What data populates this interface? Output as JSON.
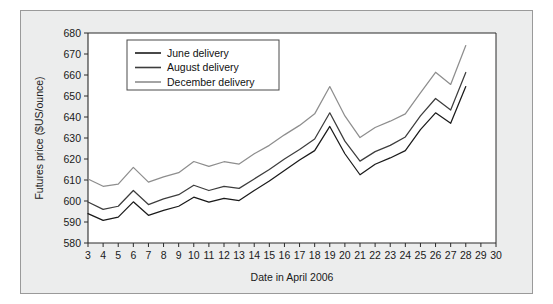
{
  "chart_data": {
    "type": "line",
    "title": "",
    "xlabel": "Date in April 2006",
    "ylabel": "Futures price ($US/ounce)",
    "xlim": [
      3,
      30
    ],
    "ylim": [
      580,
      680
    ],
    "yticks": [
      580,
      590,
      600,
      610,
      620,
      630,
      640,
      650,
      660,
      670,
      680
    ],
    "xticks": [
      3,
      4,
      5,
      6,
      7,
      8,
      9,
      10,
      11,
      12,
      13,
      14,
      15,
      16,
      17,
      18,
      19,
      20,
      21,
      22,
      23,
      24,
      25,
      26,
      27,
      28,
      29,
      30
    ],
    "grid": false,
    "legend_position": "upper-left",
    "x": [
      3,
      4,
      5,
      6,
      7,
      8,
      9,
      10,
      11,
      12,
      13,
      14,
      15,
      16,
      17,
      18,
      19,
      20,
      21,
      22,
      23,
      24,
      25,
      26,
      27,
      28
    ],
    "series": [
      {
        "name": "June delivery",
        "color": "#1a1a1a",
        "values": [
          594.0,
          590.8,
          592.3,
          599.6,
          593.2,
          595.5,
          597.5,
          601.8,
          599.5,
          601.2,
          600.2,
          605.0,
          609.5,
          614.5,
          619.5,
          624.0,
          635.5,
          622.5,
          612.5,
          617.5,
          620.5,
          624.0,
          634.0,
          642.0,
          637.0,
          654.5
        ]
      },
      {
        "name": "August delivery",
        "color": "#3d3d3d",
        "values": [
          599.5,
          596.0,
          597.5,
          605.0,
          598.3,
          601.0,
          603.0,
          607.5,
          605.0,
          607.0,
          606.0,
          610.5,
          615.0,
          620.0,
          624.5,
          629.5,
          642.0,
          628.5,
          619.0,
          623.5,
          626.5,
          630.5,
          640.5,
          648.8,
          643.3,
          661.2
        ]
      },
      {
        "name": "December delivery",
        "color": "#8e8e8e",
        "values": [
          610.5,
          607.0,
          608.0,
          616.0,
          609.0,
          611.5,
          613.5,
          618.8,
          616.5,
          618.7,
          617.6,
          622.5,
          626.5,
          631.5,
          636.0,
          641.5,
          654.5,
          640.5,
          630.2,
          635.0,
          638.0,
          641.5,
          651.5,
          661.3,
          655.5,
          674.0
        ]
      }
    ]
  },
  "legend": {
    "items": [
      {
        "label": "June delivery"
      },
      {
        "label": "August delivery"
      },
      {
        "label": "December delivery"
      }
    ]
  },
  "axes": {
    "x_title": "Date in April 2006",
    "y_title": "Futures price ($US/ounce)"
  }
}
